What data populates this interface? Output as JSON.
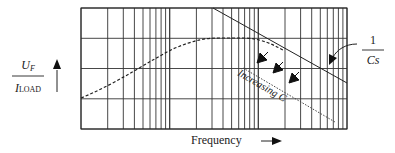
{
  "diagram": {
    "y_axis_label": {
      "numerator_main": "U",
      "numerator_sub": "F",
      "denominator_main": "I",
      "denominator_sub": "LOAD"
    },
    "x_axis_label": "Frequency",
    "asymptote_label": {
      "numerator": "1",
      "denominator": "Cs"
    },
    "annotation": "Increasing C",
    "grid": {
      "scale": "log-log",
      "x_decades": 3,
      "y_divisions": 4
    },
    "curves": [
      {
        "name": "impedance-response",
        "style": "dashed"
      },
      {
        "name": "capacitor-asymptote",
        "style": "solid",
        "label": "1/Cs"
      },
      {
        "name": "increased-capacitance-asymptote",
        "style": "dotted"
      }
    ],
    "colors": {
      "line": "#222222",
      "grid": "#333333",
      "background": "#ffffff"
    }
  }
}
